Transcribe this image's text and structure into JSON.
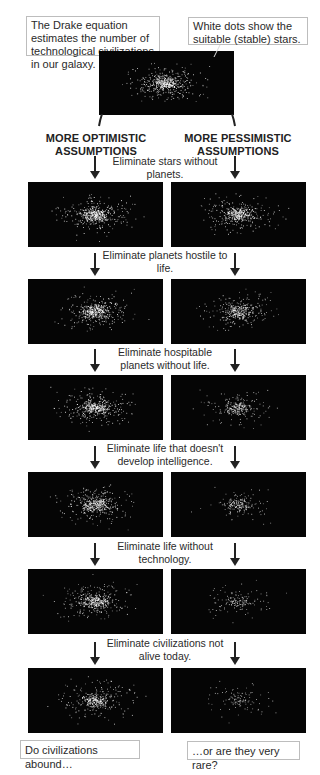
{
  "intro": {
    "drake_callout": "The Drake equation estimates the number of technological civilizations in our galaxy.",
    "dots_callout": "White dots show the suitable (stable) stars."
  },
  "columns": {
    "optimistic": "MORE OPTIMISTIC ASSUMPTIONS",
    "pessimistic": "MORE PESSIMISTIC ASSUMPTIONS"
  },
  "steps": [
    {
      "label": "Eliminate stars without planets.",
      "optimistic_density": 0.95,
      "pessimistic_density": 0.85
    },
    {
      "label": "Eliminate planets hostile to life.",
      "optimistic_density": 0.9,
      "pessimistic_density": 0.7
    },
    {
      "label": "Eliminate hospitable planets without life.",
      "optimistic_density": 0.88,
      "pessimistic_density": 0.5
    },
    {
      "label": "Eliminate life that doesn't develop intelligence.",
      "optimistic_density": 0.85,
      "pessimistic_density": 0.38
    },
    {
      "label": "Eliminate life without technology.",
      "optimistic_density": 0.82,
      "pessimistic_density": 0.3
    },
    {
      "label": "Eliminate civilizations not alive today.",
      "optimistic_density": 0.7,
      "pessimistic_density": 0.22
    }
  ],
  "conclusions": {
    "optimistic": "Do civilizations abound…",
    "pessimistic": "…or are they very rare?"
  },
  "colors": {
    "panel_bg": "#050505",
    "star": "#ffffff",
    "arrow": "#222222"
  }
}
